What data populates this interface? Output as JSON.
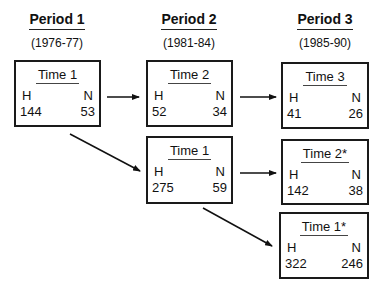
{
  "periods": [
    {
      "title": "Period 1",
      "years": "(1976-77)"
    },
    {
      "title": "Period 2",
      "years": "(1981-84)"
    },
    {
      "title": "Period 3",
      "years": "(1985-90)"
    }
  ],
  "boxes": [
    {
      "label": "Time 1",
      "h_label": "H",
      "n_label": "N",
      "h": "144",
      "n": "53"
    },
    {
      "label": "Time 2",
      "h_label": "H",
      "n_label": "N",
      "h": "52",
      "n": "34"
    },
    {
      "label": "Time 3",
      "h_label": "H",
      "n_label": "N",
      "h": "41",
      "n": "26"
    },
    {
      "label": "Time 1",
      "h_label": "H",
      "n_label": "N",
      "h": "275",
      "n": "59"
    },
    {
      "label": "Time 2*",
      "h_label": "H",
      "n_label": "N",
      "h": "142",
      "n": "38"
    },
    {
      "label": "Time 1*",
      "h_label": "H",
      "n_label": "N",
      "h": "322",
      "n": "246"
    }
  ],
  "arrows": [
    {
      "from": "Period 1 Time 1",
      "to": "Period 2 Time 2"
    },
    {
      "from": "Period 2 Time 2",
      "to": "Period 3 Time 3"
    },
    {
      "from": "Period 1 Time 1",
      "to": "Period 2 Time 1"
    },
    {
      "from": "Period 2 Time 1",
      "to": "Period 3 Time 2*"
    },
    {
      "from": "Period 2 Time 1",
      "to": "Period 3 Time 1*"
    }
  ]
}
